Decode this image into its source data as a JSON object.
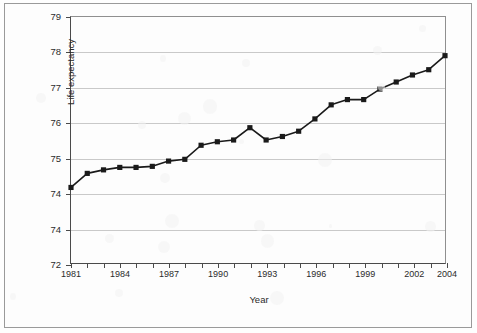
{
  "chart_data": {
    "type": "line",
    "title": "",
    "subtitle": "",
    "xlabel": "Year",
    "ylabel": "Life expectancy",
    "grid": true,
    "legend": "none",
    "marker": "filled-square",
    "line_color": "#1a1a1a",
    "grid_color": "#c9c9c9",
    "axis_color": "#4a4a4a",
    "xlim": [
      1981,
      2004
    ],
    "ylim": [
      72,
      79
    ],
    "yticks": [
      72,
      73,
      74,
      75,
      76,
      77,
      78,
      79
    ],
    "ytick_labels": [
      "72",
      "74",
      "74",
      "75",
      "76",
      "77",
      "78",
      "79"
    ],
    "xticks": [
      1981,
      1982,
      1983,
      1984,
      1985,
      1986,
      1987,
      1988,
      1989,
      1990,
      1991,
      1992,
      1993,
      1994,
      1995,
      1996,
      1997,
      1998,
      1999,
      2000,
      2001,
      2002,
      2003,
      2004
    ],
    "xtick_labels": [
      "1981",
      "1984",
      "1987",
      "1990",
      "1993",
      "1996",
      "1999",
      "2002",
      "2004"
    ],
    "xtick_label_years": [
      1981,
      1984,
      1987,
      1990,
      1993,
      1996,
      1999,
      2002,
      2004
    ],
    "x": [
      1981,
      1982,
      1983,
      1984,
      1985,
      1986,
      1987,
      1988,
      1989,
      1990,
      1991,
      1992,
      1993,
      1994,
      1995,
      1996,
      1997,
      1998,
      1999,
      2000,
      2001,
      2002,
      2003,
      2004
    ],
    "values": [
      74.15,
      74.55,
      74.65,
      74.72,
      74.72,
      74.75,
      74.9,
      74.95,
      75.35,
      75.45,
      75.5,
      75.85,
      75.5,
      75.6,
      75.75,
      76.1,
      76.5,
      76.65,
      76.65,
      76.95,
      77.15,
      77.35,
      77.5,
      77.9
    ],
    "series": [
      {
        "name": "Life expectancy",
        "values": [
          74.15,
          74.55,
          74.65,
          74.72,
          74.72,
          74.75,
          74.9,
          74.95,
          75.35,
          75.45,
          75.5,
          75.85,
          75.5,
          75.6,
          75.75,
          76.1,
          76.5,
          76.65,
          76.65,
          76.95,
          77.15,
          77.35,
          77.5,
          77.9
        ]
      }
    ]
  }
}
